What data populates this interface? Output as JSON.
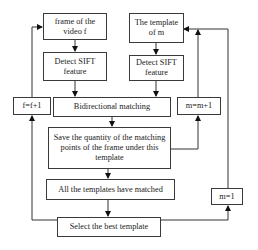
{
  "diagram": {
    "type": "flowchart",
    "nodes": {
      "frame": "frame of the video f",
      "template": "The template of m",
      "detect_left": "Detect SIFT feature",
      "detect_right": "Detect SIFT feature",
      "f_increment": "f=f+1",
      "bidirectional": "Bidirectional matching",
      "m_increment": "m=m+1",
      "save": "Save the quantity of the matching points of the frame under this template",
      "all_matched": "All the templates have matched",
      "select_best": "Select the best template",
      "m_reset": "m=1"
    },
    "edges": [
      [
        "frame",
        "detect_left"
      ],
      [
        "template",
        "detect_right"
      ],
      [
        "detect_left",
        "bidirectional"
      ],
      [
        "detect_right",
        "bidirectional"
      ],
      [
        "bidirectional",
        "save"
      ],
      [
        "save",
        "m_increment"
      ],
      [
        "m_increment",
        "template"
      ],
      [
        "save",
        "all_matched"
      ],
      [
        "all_matched",
        "select_best"
      ],
      [
        "select_best",
        "f_increment"
      ],
      [
        "f_increment",
        "frame"
      ],
      [
        "select_best",
        "m_reset"
      ],
      [
        "m_reset",
        "template"
      ]
    ]
  }
}
